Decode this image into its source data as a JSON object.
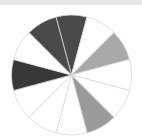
{
  "chart_data": {
    "type": "pie",
    "title": "",
    "center": [
      71.5,
      75
    ],
    "radius": 60,
    "start_angle_deg": -15,
    "direction": "clockwise",
    "slice_border_color": "#d8d8d8",
    "slices": [
      {
        "label": "",
        "value": 1,
        "color": "#4a4a4a"
      },
      {
        "label": "",
        "value": 1,
        "color": "#ffffff"
      },
      {
        "label": "",
        "value": 1,
        "color": "#a9a9a9"
      },
      {
        "label": "",
        "value": 1,
        "color": "#ffffff"
      },
      {
        "label": "",
        "value": 1,
        "color": "#ffffff"
      },
      {
        "label": "",
        "value": 1,
        "color": "#9a9a9a"
      },
      {
        "label": "",
        "value": 1,
        "color": "#ffffff"
      },
      {
        "label": "",
        "value": 1,
        "color": "#ffffff"
      },
      {
        "label": "",
        "value": 1,
        "color": "#ffffff"
      },
      {
        "label": "",
        "value": 1,
        "color": "#383838"
      },
      {
        "label": "",
        "value": 1,
        "color": "#ffffff"
      },
      {
        "label": "",
        "value": 1,
        "color": "#4a4a4a"
      }
    ],
    "legend": []
  },
  "header": {
    "bar_color": "#e6e6e6"
  }
}
